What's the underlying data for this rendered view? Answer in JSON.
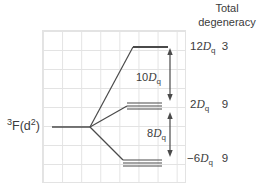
{
  "colors": {
    "line": "#4a4a4a",
    "grid": "#e3e3e3",
    "text": "#3b3b3b",
    "background": "#ffffff"
  },
  "header": {
    "line1": "Total",
    "line2": "degeneracy"
  },
  "term": {
    "superscript": "3",
    "body": "F(d",
    "exponent": "2",
    "close": ")"
  },
  "splittings": [
    {
      "coefficient": "10",
      "symbol": "D",
      "subscript": "q"
    },
    {
      "coefficient": "8",
      "symbol": "D",
      "subscript": "q"
    }
  ],
  "levels": [
    {
      "coefficient": "12",
      "symbol": "D",
      "subscript": "q",
      "degeneracy": "3"
    },
    {
      "coefficient": "2",
      "symbol": "D",
      "subscript": "q",
      "degeneracy": "9"
    },
    {
      "coefficient": "−6",
      "symbol": "D",
      "subscript": "q",
      "degeneracy": "9"
    }
  ]
}
